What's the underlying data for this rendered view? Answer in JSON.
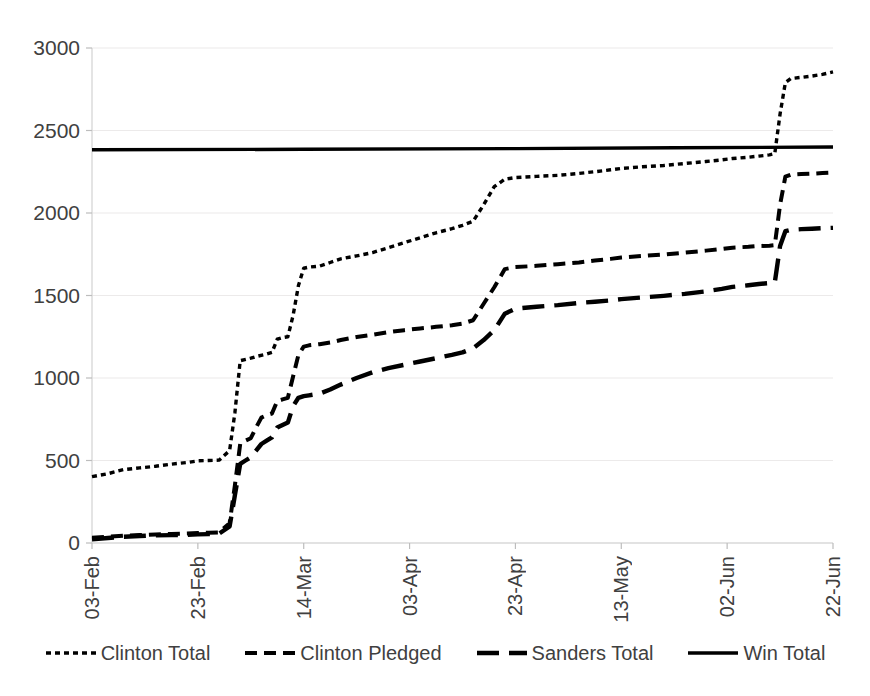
{
  "chart_data": {
    "type": "line",
    "title": "",
    "subtitle": "",
    "xlabel": "",
    "ylabel": "",
    "ylim": [
      0,
      3000
    ],
    "y_ticks": [
      0,
      500,
      1000,
      1500,
      2000,
      2500,
      3000
    ],
    "y_tick_labels": [
      "0",
      "500",
      "1000",
      "1500",
      "2000",
      "2500",
      "3000"
    ],
    "x_ticks": [
      "03-Feb",
      "23-Feb",
      "14-Mar",
      "03-Apr",
      "23-Apr",
      "13-May",
      "02-Jun",
      "22-Jun"
    ],
    "x_tick_labels": [
      "03-Feb",
      "23-Feb",
      "14-Mar",
      "03-Apr",
      "23-Apr",
      "13-May",
      "02-Jun",
      "22-Jun"
    ],
    "x_range_days": [
      0,
      140
    ],
    "x_tick_days": [
      0,
      20,
      40,
      60,
      80,
      100,
      120,
      140
    ],
    "grid": true,
    "grid_axis": "y",
    "legend_position": "bottom",
    "series": [
      {
        "name": "Clinton Total",
        "style": "dotted",
        "color": "#000000",
        "points": [
          [
            0,
            402
          ],
          [
            3,
            420
          ],
          [
            6,
            445
          ],
          [
            9,
            455
          ],
          [
            12,
            465
          ],
          [
            15,
            478
          ],
          [
            18,
            488
          ],
          [
            20,
            498
          ],
          [
            22,
            500
          ],
          [
            24,
            502
          ],
          [
            26,
            560
          ],
          [
            27,
            790
          ],
          [
            28,
            1105
          ],
          [
            30,
            1120
          ],
          [
            31,
            1130
          ],
          [
            33,
            1145
          ],
          [
            34,
            1155
          ],
          [
            35,
            1235
          ],
          [
            36,
            1245
          ],
          [
            37,
            1250
          ],
          [
            38,
            1380
          ],
          [
            39,
            1560
          ],
          [
            40,
            1665
          ],
          [
            41,
            1672
          ],
          [
            43,
            1678
          ],
          [
            45,
            1700
          ],
          [
            47,
            1722
          ],
          [
            50,
            1740
          ],
          [
            53,
            1760
          ],
          [
            56,
            1790
          ],
          [
            59,
            1820
          ],
          [
            62,
            1850
          ],
          [
            65,
            1880
          ],
          [
            68,
            1905
          ],
          [
            70,
            1925
          ],
          [
            72,
            1950
          ],
          [
            74,
            2050
          ],
          [
            76,
            2160
          ],
          [
            78,
            2205
          ],
          [
            80,
            2215
          ],
          [
            84,
            2222
          ],
          [
            88,
            2228
          ],
          [
            92,
            2240
          ],
          [
            95,
            2250
          ],
          [
            98,
            2262
          ],
          [
            100,
            2270
          ],
          [
            104,
            2280
          ],
          [
            108,
            2288
          ],
          [
            112,
            2300
          ],
          [
            116,
            2312
          ],
          [
            119,
            2322
          ],
          [
            121,
            2330
          ],
          [
            124,
            2338
          ],
          [
            126,
            2345
          ],
          [
            128,
            2352
          ],
          [
            129,
            2360
          ],
          [
            130,
            2600
          ],
          [
            131,
            2790
          ],
          [
            132,
            2815
          ],
          [
            134,
            2822
          ],
          [
            136,
            2830
          ],
          [
            138,
            2840
          ],
          [
            140,
            2855
          ]
        ]
      },
      {
        "name": "Clinton Pledged",
        "style": "dashed-medium",
        "color": "#000000",
        "points": [
          [
            0,
            32
          ],
          [
            3,
            38
          ],
          [
            6,
            45
          ],
          [
            9,
            48
          ],
          [
            12,
            52
          ],
          [
            15,
            55
          ],
          [
            18,
            58
          ],
          [
            20,
            60
          ],
          [
            22,
            62
          ],
          [
            24,
            64
          ],
          [
            26,
            120
          ],
          [
            27,
            350
          ],
          [
            28,
            600
          ],
          [
            29,
            620
          ],
          [
            30,
            635
          ],
          [
            31,
            700
          ],
          [
            32,
            760
          ],
          [
            33,
            775
          ],
          [
            34,
            785
          ],
          [
            35,
            860
          ],
          [
            36,
            870
          ],
          [
            37,
            880
          ],
          [
            38,
            1010
          ],
          [
            39,
            1140
          ],
          [
            40,
            1190
          ],
          [
            41,
            1198
          ],
          [
            43,
            1205
          ],
          [
            45,
            1215
          ],
          [
            47,
            1230
          ],
          [
            50,
            1248
          ],
          [
            53,
            1262
          ],
          [
            56,
            1278
          ],
          [
            59,
            1290
          ],
          [
            62,
            1300
          ],
          [
            65,
            1310
          ],
          [
            68,
            1320
          ],
          [
            70,
            1330
          ],
          [
            72,
            1350
          ],
          [
            74,
            1450
          ],
          [
            76,
            1550
          ],
          [
            78,
            1660
          ],
          [
            80,
            1672
          ],
          [
            84,
            1680
          ],
          [
            88,
            1690
          ],
          [
            92,
            1700
          ],
          [
            95,
            1712
          ],
          [
            98,
            1722
          ],
          [
            100,
            1730
          ],
          [
            104,
            1740
          ],
          [
            108,
            1748
          ],
          [
            112,
            1760
          ],
          [
            116,
            1772
          ],
          [
            119,
            1782
          ],
          [
            121,
            1790
          ],
          [
            124,
            1795
          ],
          [
            126,
            1800
          ],
          [
            128,
            1802
          ],
          [
            129,
            1805
          ],
          [
            130,
            2050
          ],
          [
            131,
            2220
          ],
          [
            132,
            2232
          ],
          [
            134,
            2236
          ],
          [
            136,
            2238
          ],
          [
            138,
            2242
          ],
          [
            140,
            2245
          ]
        ]
      },
      {
        "name": "Sanders Total",
        "style": "dashed-long",
        "color": "#000000",
        "points": [
          [
            0,
            22
          ],
          [
            3,
            30
          ],
          [
            6,
            38
          ],
          [
            9,
            42
          ],
          [
            12,
            46
          ],
          [
            15,
            48
          ],
          [
            18,
            50
          ],
          [
            20,
            52
          ],
          [
            22,
            54
          ],
          [
            24,
            56
          ],
          [
            26,
            100
          ],
          [
            27,
            290
          ],
          [
            28,
            480
          ],
          [
            29,
            500
          ],
          [
            30,
            520
          ],
          [
            31,
            560
          ],
          [
            32,
            600
          ],
          [
            33,
            620
          ],
          [
            34,
            640
          ],
          [
            35,
            700
          ],
          [
            36,
            715
          ],
          [
            37,
            730
          ],
          [
            38,
            830
          ],
          [
            39,
            880
          ],
          [
            40,
            890
          ],
          [
            41,
            895
          ],
          [
            43,
            905
          ],
          [
            45,
            930
          ],
          [
            47,
            960
          ],
          [
            50,
            1000
          ],
          [
            53,
            1035
          ],
          [
            56,
            1060
          ],
          [
            59,
            1080
          ],
          [
            62,
            1100
          ],
          [
            65,
            1120
          ],
          [
            68,
            1140
          ],
          [
            70,
            1155
          ],
          [
            72,
            1180
          ],
          [
            74,
            1230
          ],
          [
            76,
            1290
          ],
          [
            78,
            1390
          ],
          [
            80,
            1420
          ],
          [
            84,
            1432
          ],
          [
            88,
            1442
          ],
          [
            92,
            1455
          ],
          [
            95,
            1462
          ],
          [
            98,
            1470
          ],
          [
            100,
            1478
          ],
          [
            104,
            1488
          ],
          [
            108,
            1498
          ],
          [
            112,
            1510
          ],
          [
            116,
            1525
          ],
          [
            119,
            1540
          ],
          [
            121,
            1552
          ],
          [
            124,
            1562
          ],
          [
            126,
            1570
          ],
          [
            128,
            1575
          ],
          [
            129,
            1578
          ],
          [
            130,
            1800
          ],
          [
            131,
            1890
          ],
          [
            132,
            1898
          ],
          [
            134,
            1902
          ],
          [
            136,
            1905
          ],
          [
            138,
            1908
          ],
          [
            140,
            1910
          ]
        ]
      },
      {
        "name": "Win Total",
        "style": "solid",
        "color": "#000000",
        "points": [
          [
            0,
            2383
          ],
          [
            40,
            2386
          ],
          [
            80,
            2390
          ],
          [
            110,
            2395
          ],
          [
            140,
            2400
          ]
        ]
      }
    ]
  },
  "legend": {
    "items": [
      {
        "label": "Clinton Total",
        "style": "dotted"
      },
      {
        "label": "Clinton Pledged",
        "style": "dashed-medium"
      },
      {
        "label": "Sanders Total",
        "style": "dashed-long"
      },
      {
        "label": "Win Total",
        "style": "solid"
      }
    ]
  },
  "artifact": {
    "bottom_text": ""
  }
}
